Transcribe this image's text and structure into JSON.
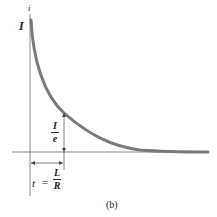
{
  "figure": {
    "panel_label": "(b)",
    "y_axis_label": "I",
    "y_axis_var": "i",
    "decay_label": {
      "numerator": "I",
      "denominator": "e"
    },
    "time_label": {
      "lhs": "t",
      "eq": "=",
      "numerator": "L",
      "denominator": "R"
    }
  },
  "colors": {
    "curve": "#7a7a7a",
    "axis": "#888888",
    "text": "#222222"
  }
}
